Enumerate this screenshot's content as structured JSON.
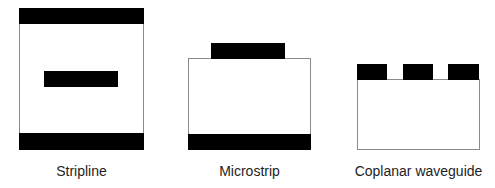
{
  "diagram": {
    "kind": "transmission-line cross-sections",
    "colors": {
      "conductor": "#000000",
      "substrate_fill": "#ffffff",
      "substrate_border": "#8a8a8a",
      "label": "#1e1e1e"
    },
    "structures": [
      {
        "id": "stripline",
        "label": "Stripline",
        "layers": [
          "top ground plane",
          "dielectric",
          "center strip conductor",
          "bottom ground plane"
        ]
      },
      {
        "id": "microstrip",
        "label": "Microstrip",
        "layers": [
          "top strip conductor",
          "dielectric substrate",
          "bottom ground plane"
        ]
      },
      {
        "id": "cpw",
        "label": "Coplanar waveguide",
        "layers": [
          "ground conductor (left)",
          "center signal conductor",
          "ground conductor (right)",
          "dielectric substrate"
        ]
      }
    ]
  }
}
